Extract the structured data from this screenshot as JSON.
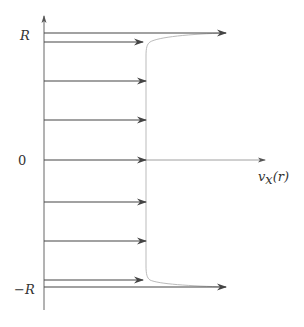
{
  "diagram": {
    "title": "",
    "labels": {
      "top": "R",
      "zero": "0",
      "bottom": "−R",
      "x_axis": "v",
      "x_axis_sub": "x",
      "x_axis_arg": "(r)"
    },
    "colors": {
      "axis": "#555555",
      "arrow": "#444444",
      "profile": "#bbbbbb"
    },
    "arrows": [
      {
        "name": "wall-top",
        "y": 33,
        "tip": 226
      },
      {
        "name": "near-wall-top",
        "y": 42,
        "tip": 143
      },
      {
        "name": "row-1",
        "y": 81,
        "tip": 146
      },
      {
        "name": "row-2",
        "y": 120,
        "tip": 146
      },
      {
        "name": "row-center",
        "y": 160,
        "tip": 146
      },
      {
        "name": "row-4",
        "y": 202,
        "tip": 146
      },
      {
        "name": "row-5",
        "y": 241,
        "tip": 146
      },
      {
        "name": "near-wall-bottom",
        "y": 280,
        "tip": 143
      },
      {
        "name": "wall-bottom",
        "y": 286,
        "tip": 226
      }
    ]
  }
}
